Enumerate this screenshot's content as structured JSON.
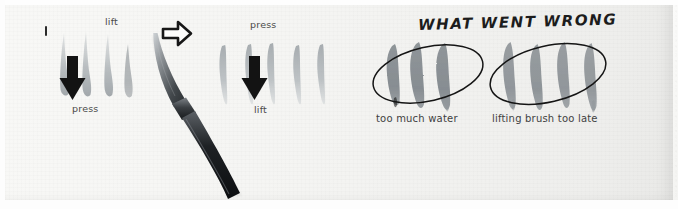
{
  "scene": {
    "medium": "watercolor brush stroke practice sheet (photograph)",
    "paper_color": "#f5f5f3",
    "ink_color": "#9aa0a4",
    "dark_ink_color": "#8e9498",
    "marker_color": "#1c1c1c"
  },
  "panels": {
    "step1": {
      "number_mark": "1",
      "top_label": "lift",
      "bottom_label": "press",
      "arrow_direction": "down",
      "stroke_count": 4,
      "stroke_shape": "thin-top-wide-bottom"
    },
    "step2": {
      "top_label": "press",
      "bottom_label": "lift",
      "arrow_direction": "down",
      "stroke_count": 5,
      "stroke_shape": "wide-top-thin-bottom"
    },
    "transition_arrow": "arrow-right-outline",
    "brush": {
      "name": "round watercolor brush",
      "orientation": "diagonal"
    }
  },
  "critique": {
    "title": "WHAT WENT WRONG",
    "examples": [
      {
        "caption": "too much water",
        "stroke_count": 3,
        "circled": true
      },
      {
        "caption": "lifting brush too late",
        "stroke_count": 4,
        "circled": true
      }
    ]
  }
}
